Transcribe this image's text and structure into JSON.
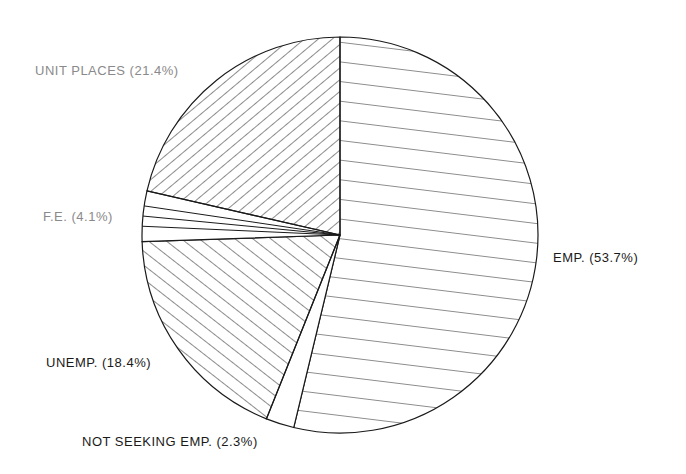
{
  "chart_data": {
    "type": "pie",
    "title": "",
    "start_angle_deg": 0,
    "direction": "clockwise",
    "slices": [
      {
        "label": "EMP.",
        "value": 53.7,
        "display": "EMP. (53.7%)",
        "pattern": "horizontal"
      },
      {
        "label": "NOT SEEKING EMP.",
        "value": 2.3,
        "display": "NOT SEEKING EMP. (2.3%)",
        "pattern": "none"
      },
      {
        "label": "UNEMP.",
        "value": 18.4,
        "display": "UNEMP. (18.4%)",
        "pattern": "diagonal-up"
      },
      {
        "label": "F.E.",
        "value": 4.1,
        "display": "F.E. (4.1%)",
        "pattern": "radial-lines"
      },
      {
        "label": "UNIT PLACES",
        "value": 21.4,
        "display": "UNIT PLACES (21.4%)",
        "pattern": "diagonal-down"
      }
    ],
    "categories": [
      "EMP.",
      "NOT SEEKING EMP.",
      "UNEMP.",
      "F.E.",
      "UNIT PLACES"
    ],
    "values": [
      53.7,
      2.3,
      18.4,
      4.1,
      21.4
    ],
    "legend": "none (inline labels)"
  },
  "labels": {
    "emp": "EMP. (53.7%)",
    "not_seeking": "NOT SEEKING EMP. (2.3%)",
    "unemp": "UNEMP. (18.4%)",
    "fe": "F.E. (4.1%)",
    "unit_places": "UNIT PLACES (21.4%)"
  },
  "colors": {
    "stroke": "#1a1a1a",
    "background": "#ffffff"
  }
}
